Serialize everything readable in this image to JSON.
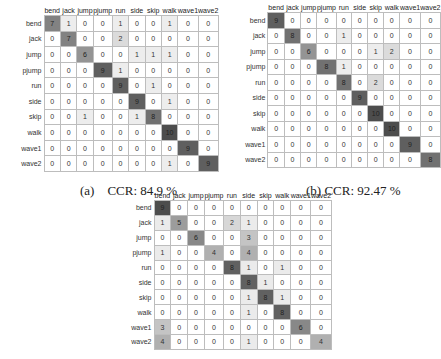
{
  "chart_data": [
    {
      "type": "heatmap",
      "title": "(a) CCR: 84.9 %",
      "caption_label": "(a)",
      "caption_text": "CCR: 84.9 %",
      "ccr_percent": 84.9,
      "classes": [
        "bend",
        "jack",
        "jump",
        "pjump",
        "run",
        "side",
        "skip",
        "walk",
        "wave1",
        "wave2"
      ],
      "col_labels": [
        "bend",
        "jack",
        "jump",
        "pjump",
        "run",
        "side",
        "skip",
        "walk",
        "wave1",
        "wave2"
      ],
      "matrix": [
        [
          7,
          1,
          0,
          0,
          1,
          0,
          0,
          1,
          0,
          0
        ],
        [
          0,
          7,
          0,
          0,
          2,
          0,
          0,
          0,
          0,
          0
        ],
        [
          0,
          0,
          6,
          0,
          0,
          1,
          1,
          1,
          0,
          0
        ],
        [
          0,
          0,
          0,
          9,
          1,
          0,
          0,
          0,
          0,
          0
        ],
        [
          0,
          0,
          0,
          0,
          9,
          0,
          1,
          0,
          0,
          0
        ],
        [
          0,
          0,
          0,
          0,
          0,
          9,
          0,
          1,
          0,
          0
        ],
        [
          0,
          0,
          1,
          0,
          0,
          1,
          8,
          0,
          0,
          0
        ],
        [
          0,
          0,
          0,
          0,
          0,
          0,
          0,
          10,
          0,
          0
        ],
        [
          0,
          0,
          0,
          0,
          0,
          0,
          0,
          0,
          9,
          0
        ],
        [
          0,
          0,
          0,
          0,
          0,
          0,
          0,
          1,
          0,
          9
        ]
      ]
    },
    {
      "type": "heatmap",
      "title": "(b) CCR: 92.47 %",
      "caption_label": "(b)",
      "caption_text": "CCR: 92.47 %",
      "ccr_percent": 92.47,
      "classes": [
        "bend",
        "jack",
        "jump",
        "pjump",
        "run",
        "side",
        "skip",
        "walk",
        "wave1",
        "wave2"
      ],
      "col_labels": [
        "bend",
        "jack",
        "jump",
        "pjump",
        "run",
        "side",
        "skip",
        "walk",
        "wave1",
        "wave2"
      ],
      "matrix": [
        [
          9,
          0,
          0,
          0,
          0,
          0,
          0,
          0,
          0,
          0
        ],
        [
          0,
          8,
          0,
          0,
          1,
          0,
          0,
          0,
          0,
          0
        ],
        [
          0,
          0,
          6,
          0,
          0,
          0,
          1,
          2,
          0,
          0
        ],
        [
          0,
          0,
          0,
          8,
          1,
          0,
          0,
          0,
          0,
          0
        ],
        [
          0,
          0,
          0,
          0,
          8,
          0,
          2,
          0,
          0,
          0
        ],
        [
          0,
          0,
          0,
          0,
          0,
          9,
          0,
          0,
          0,
          0
        ],
        [
          0,
          0,
          0,
          0,
          0,
          0,
          10,
          0,
          0,
          0
        ],
        [
          0,
          0,
          0,
          0,
          0,
          0,
          0,
          10,
          0,
          0
        ],
        [
          0,
          0,
          0,
          0,
          0,
          0,
          0,
          0,
          9,
          0
        ],
        [
          0,
          0,
          0,
          0,
          0,
          0,
          0,
          0,
          0,
          8
        ]
      ]
    },
    {
      "type": "heatmap",
      "title": "",
      "caption_label": "(c)",
      "caption_text": "",
      "classes": [
        "bend",
        "jack",
        "jump",
        "pjump",
        "run",
        "side",
        "skip",
        "walk",
        "wave1",
        "wave2"
      ],
      "col_labels": [
        "bend",
        "jack",
        "jump",
        "pjump",
        "run",
        "side",
        "skip",
        "walk",
        "wave1",
        "wave2"
      ],
      "matrix": [
        [
          9,
          0,
          0,
          0,
          0,
          0,
          0,
          0,
          0,
          0
        ],
        [
          1,
          5,
          0,
          0,
          2,
          1,
          0,
          0,
          0,
          0
        ],
        [
          0,
          0,
          6,
          0,
          0,
          3,
          0,
          0,
          0,
          0
        ],
        [
          1,
          0,
          0,
          4,
          0,
          4,
          0,
          0,
          0,
          0
        ],
        [
          0,
          0,
          0,
          0,
          8,
          1,
          0,
          1,
          0,
          0
        ],
        [
          0,
          0,
          0,
          0,
          0,
          8,
          1,
          0,
          0,
          0
        ],
        [
          0,
          0,
          0,
          0,
          0,
          1,
          8,
          1,
          0,
          0
        ],
        [
          0,
          0,
          0,
          0,
          0,
          1,
          0,
          8,
          0,
          0
        ],
        [
          3,
          0,
          0,
          0,
          0,
          0,
          0,
          0,
          6,
          0
        ],
        [
          4,
          0,
          0,
          0,
          0,
          1,
          0,
          0,
          0,
          4
        ]
      ]
    }
  ],
  "colors": {
    "grid": "#bdbdbd",
    "max_cell": "#4d4d4d",
    "zero_cell": "#ffffff"
  }
}
